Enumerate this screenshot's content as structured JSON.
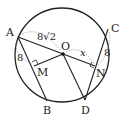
{
  "diagram": {
    "circle": {
      "cx": 62,
      "cy": 55,
      "r": 47
    },
    "points": {
      "A": {
        "x": 18,
        "y": 37,
        "label": "A"
      },
      "B": {
        "x": 47,
        "y": 100,
        "label": "B"
      },
      "C": {
        "x": 108,
        "y": 29,
        "label": "C"
      },
      "D": {
        "x": 85,
        "y": 99,
        "label": "D"
      },
      "O": {
        "x": 63,
        "y": 54,
        "label": "O"
      },
      "M": {
        "x": 34,
        "y": 66,
        "label": "M"
      },
      "N": {
        "x": 95,
        "y": 67,
        "label": "N"
      }
    },
    "measures": {
      "AO": "8√2",
      "AM": "8",
      "CN": "8",
      "ON": "x"
    }
  }
}
